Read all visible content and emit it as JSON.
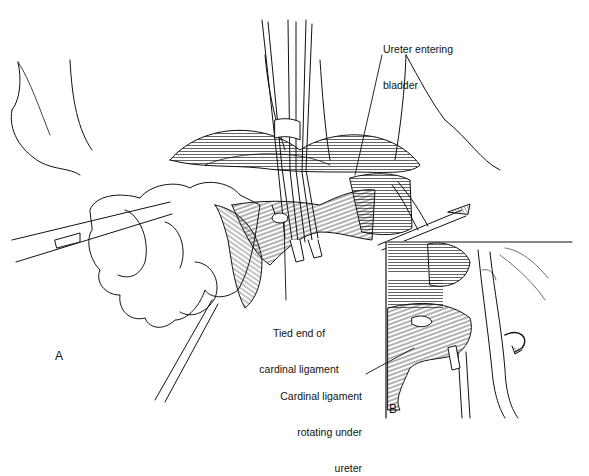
{
  "figure": {
    "panels": [
      {
        "id": "A",
        "label": "A"
      },
      {
        "id": "B",
        "label": "B"
      }
    ],
    "annotations": [
      {
        "id": "ureter",
        "line1": "Ureter entering",
        "line2": "bladder",
        "panel": "A"
      },
      {
        "id": "tied-end",
        "line1": "Tied end of",
        "line2": "cardinal ligament",
        "panel": "A"
      },
      {
        "id": "rotating",
        "line1": "Cardinal ligament",
        "line2": "rotating under",
        "line3": "ureter",
        "panel": "B"
      }
    ],
    "colors": {
      "ink": "#111111",
      "background": "#ffffff"
    }
  }
}
